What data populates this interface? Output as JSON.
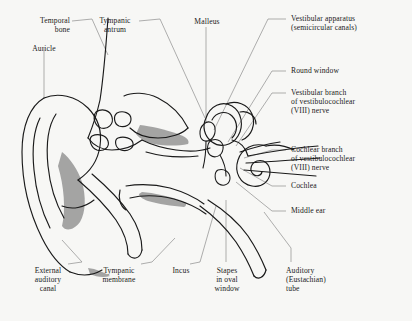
{
  "figure": {
    "type": "anatomical-diagram",
    "background_color": "#f7f7f5",
    "line_color": "#1a1a1a",
    "leader_color": "#8c8c8c",
    "shade_color": "#9a9a9a"
  },
  "labels": {
    "temporal_bone": "Temporal\nbone",
    "auricle": "Auricle",
    "tympanic_antrum": "Tympanic\nantrum",
    "malleus": "Malleus",
    "vestibular_apparatus": "Vestibular apparatus\n(semicircular canals)",
    "round_window": "Round window",
    "vestibular_branch": "Vestibular branch\nof vestibulocochlear\n(VIII) nerve",
    "cochlear_branch": "Cochlear branch\nof vestibulocochlear\n(VIII) nerve",
    "cochlea": "Cochlea",
    "middle_ear": "Middle ear",
    "external_auditory_canal": "External\nauditory\ncanal",
    "tympanic_membrane": "Tympanic\nmembrane",
    "incus": "Incus",
    "stapes": "Stapes\nin oval\nwindow",
    "auditory_tube": "Auditory\n(Eustachian)\ntube"
  },
  "parts": [
    {
      "id": "temporal-bone",
      "label": "Temporal bone",
      "side": "top-left"
    },
    {
      "id": "auricle",
      "label": "Auricle",
      "side": "top-left"
    },
    {
      "id": "tympanic-antrum",
      "label": "Tympanic antrum",
      "side": "top-left"
    },
    {
      "id": "malleus",
      "label": "Malleus",
      "side": "top-center"
    },
    {
      "id": "vestibular-apparatus",
      "label": "Vestibular apparatus (semicircular canals)",
      "side": "top-right"
    },
    {
      "id": "round-window",
      "label": "Round window",
      "side": "right"
    },
    {
      "id": "vestibular-branch",
      "label": "Vestibular branch of vestibulocochlear (VIII) nerve",
      "side": "right"
    },
    {
      "id": "cochlear-branch",
      "label": "Cochlear branch of vestibulocochlear (VIII) nerve",
      "side": "right"
    },
    {
      "id": "cochlea",
      "label": "Cochlea",
      "side": "right"
    },
    {
      "id": "middle-ear",
      "label": "Middle ear",
      "side": "right"
    },
    {
      "id": "external-auditory-canal",
      "label": "External auditory canal",
      "side": "bottom-left"
    },
    {
      "id": "tympanic-membrane",
      "label": "Tympanic membrane",
      "side": "bottom-left"
    },
    {
      "id": "incus",
      "label": "Incus",
      "side": "bottom-center"
    },
    {
      "id": "stapes",
      "label": "Stapes in oval window",
      "side": "bottom-center"
    },
    {
      "id": "auditory-tube",
      "label": "Auditory (Eustachian) tube",
      "side": "bottom-right"
    }
  ]
}
